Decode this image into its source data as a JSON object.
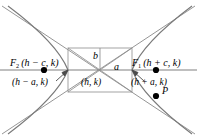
{
  "figure": {
    "type": "hyperbola-diagram",
    "colors": {
      "curve": "#7a7a7a",
      "asymptote": "#8a8a8a",
      "axis": "#808080",
      "rectangle": "#9a9a9a",
      "text": "#000000",
      "point": "#000000",
      "background": "#ffffff"
    },
    "labels": {
      "focus_left": {
        "name": "F",
        "sub": "2",
        "coords": "(h − c, k)"
      },
      "focus_right": {
        "name": "F",
        "sub": "1",
        "coords": "(h + c, k)"
      },
      "vertex_left": "(h − a, k)",
      "vertex_right": "(h + a, k)",
      "center": "(h, k)",
      "semi_conjugate": "b",
      "semi_transverse": "a",
      "point_on_curve": "P"
    },
    "geometry": {
      "center": {
        "x": 100,
        "y": 70
      },
      "a": 32,
      "b": 22,
      "c": 56,
      "vertex_left": {
        "x": 68,
        "y": 70
      },
      "vertex_right": {
        "x": 132,
        "y": 70
      },
      "focus_left": {
        "x": 44,
        "y": 70
      },
      "focus_right": {
        "x": 156,
        "y": 70
      },
      "point_p": {
        "x": 156,
        "y": 96
      },
      "rectangle": {
        "x1": 68,
        "y1": 48,
        "x2": 132,
        "y2": 92
      }
    }
  }
}
